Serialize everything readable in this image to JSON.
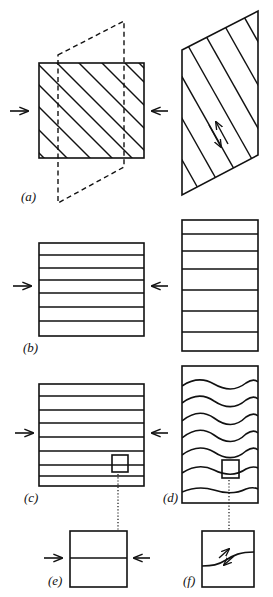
{
  "figure": {
    "colors": {
      "ink": "#111111",
      "background": "#ffffff"
    }
  },
  "panels": [
    {
      "id": "a",
      "label": "(a)",
      "content": "Square with diagonal hatched layers under compression; dashed outline showing sheared shape; resulting parallelogram with shear-sense arrows"
    },
    {
      "id": "b",
      "label": "(b)",
      "content": "Square with horizontal layers under compression; resulting taller rectangle with thickened layers"
    },
    {
      "id": "c",
      "label": "(c)",
      "content": "Square with horizontal layers under compression, small inset box marked"
    },
    {
      "id": "d",
      "label": "(d)",
      "content": "Tall rectangle with buckled (wavy) layers, small inset box marked"
    },
    {
      "id": "e",
      "label": "(e)",
      "content": "Enlarged inset from (c): single horizontal layer under compression"
    },
    {
      "id": "f",
      "label": "(f)",
      "content": "Enlarged inset from (d): inclined layer segment with shear-sense arrows"
    }
  ],
  "arrows": {
    "compression_left": "right-arrow-icon",
    "compression_right": "left-arrow-icon",
    "shear": "shear-sense-arrows-icon"
  }
}
